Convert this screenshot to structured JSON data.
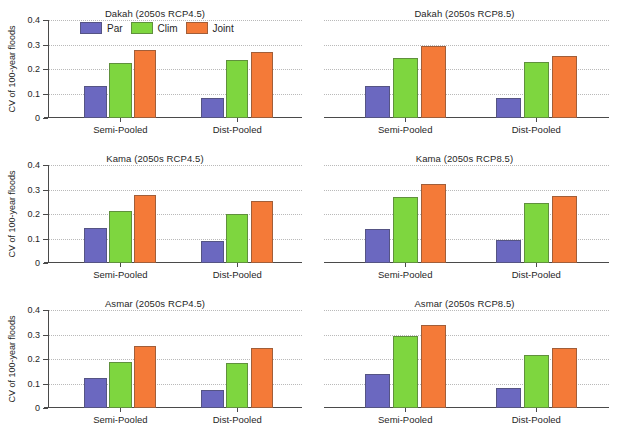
{
  "chart_data": {
    "type": "bar",
    "ylabel": "CV of 100-year floods",
    "xlabel": "",
    "categories": [
      "Semi-Pooled",
      "Dist-Pooled"
    ],
    "ylim": [
      0,
      0.4
    ],
    "ytick_labels": [
      "0",
      "0.1",
      "0.2",
      "0.3",
      "0.4"
    ],
    "ytick_values": [
      0,
      0.1,
      0.2,
      0.3,
      0.4
    ],
    "grid": true,
    "legend_position": "top-center-first-panel",
    "legend": [
      {
        "name": "Par",
        "color": "#6b68c0"
      },
      {
        "name": "Clim",
        "color": "#7ed63f"
      },
      {
        "name": "Joint",
        "color": "#f47a38"
      }
    ],
    "panels": [
      {
        "title": "Dakah (2050s RCP4.5)",
        "site": "Dakah",
        "scenario": "2050s RCP4.5",
        "show_yaxis": true,
        "show_legend": true,
        "series": [
          {
            "name": "Par",
            "values": [
              0.13,
              0.08
            ]
          },
          {
            "name": "Clim",
            "values": [
              0.223,
              0.237
            ]
          },
          {
            "name": "Joint",
            "values": [
              0.277,
              0.268
            ]
          }
        ]
      },
      {
        "title": "Dakah (2050s RCP8.5)",
        "site": "Dakah",
        "scenario": "2050s RCP8.5",
        "show_yaxis": false,
        "show_legend": false,
        "series": [
          {
            "name": "Par",
            "values": [
              0.13,
              0.082
            ]
          },
          {
            "name": "Clim",
            "values": [
              0.243,
              0.228
            ]
          },
          {
            "name": "Joint",
            "values": [
              0.295,
              0.255
            ]
          }
        ]
      },
      {
        "title": "Kama (2050s RCP4.5)",
        "site": "Kama",
        "scenario": "2050s RCP4.5",
        "show_yaxis": true,
        "show_legend": false,
        "series": [
          {
            "name": "Par",
            "values": [
              0.142,
              0.089
            ]
          },
          {
            "name": "Clim",
            "values": [
              0.211,
              0.201
            ]
          },
          {
            "name": "Joint",
            "values": [
              0.277,
              0.253
            ]
          }
        ]
      },
      {
        "title": "Kama (2050s RCP8.5)",
        "site": "Kama",
        "scenario": "2050s RCP8.5",
        "show_yaxis": false,
        "show_legend": false,
        "series": [
          {
            "name": "Par",
            "values": [
              0.14,
              0.092
            ]
          },
          {
            "name": "Clim",
            "values": [
              0.268,
              0.245
            ]
          },
          {
            "name": "Joint",
            "values": [
              0.322,
              0.272
            ]
          }
        ]
      },
      {
        "title": "Asmar (2050s RCP4.5)",
        "site": "Asmar",
        "scenario": "2050s RCP4.5",
        "show_yaxis": true,
        "show_legend": false,
        "series": [
          {
            "name": "Par",
            "values": [
              0.123,
              0.072
            ]
          },
          {
            "name": "Clim",
            "values": [
              0.187,
              0.183
            ]
          },
          {
            "name": "Joint",
            "values": [
              0.252,
              0.244
            ]
          }
        ]
      },
      {
        "title": "Asmar (2050s RCP8.5)",
        "site": "Asmar",
        "scenario": "2050s RCP8.5",
        "show_yaxis": false,
        "show_legend": false,
        "series": [
          {
            "name": "Par",
            "values": [
              0.137,
              0.08
            ]
          },
          {
            "name": "Clim",
            "values": [
              0.295,
              0.215
            ]
          },
          {
            "name": "Joint",
            "values": [
              0.34,
              0.245
            ]
          }
        ]
      }
    ]
  }
}
